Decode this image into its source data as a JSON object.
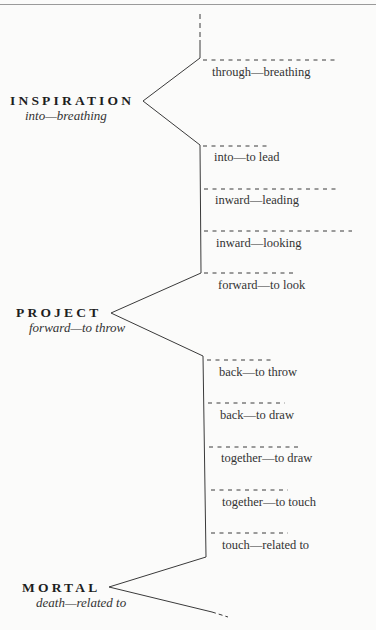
{
  "diagram": {
    "type": "etymology-tree",
    "stroke_color": "#3a3a3a",
    "words": [
      {
        "word": "INSPIRATION",
        "gloss": "into—breathing"
      },
      {
        "word": "PROJECT",
        "gloss": "forward—to throw"
      },
      {
        "word": "MORTAL",
        "gloss": "death—related to"
      }
    ],
    "branches": [
      {
        "label": "through—breathing"
      },
      {
        "label": "into—to lead"
      },
      {
        "label": "inward—leading"
      },
      {
        "label": "inward—looking"
      },
      {
        "label": "forward—to look"
      },
      {
        "label": "back—to throw"
      },
      {
        "label": "back—to draw"
      },
      {
        "label": "together—to draw"
      },
      {
        "label": "together—to touch"
      },
      {
        "label": "touch—related to"
      }
    ]
  }
}
